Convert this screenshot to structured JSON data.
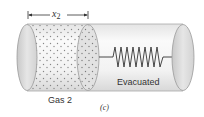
{
  "figure": {
    "dimension": {
      "symbol": "x",
      "subscript": "2"
    },
    "region_labels": {
      "gas": "Gas 2",
      "vacuum": "Evacuated"
    },
    "caption": "(c)"
  },
  "colors": {
    "cylinder_fill": "#eeeeee",
    "cylinder_edge": "#a8a8a8",
    "cap_fill": "#dcdcdc",
    "gas_dots": "#7a7a7a",
    "spring": "#333333",
    "text": "#333333"
  },
  "components": [
    {
      "name": "left-end-cap"
    },
    {
      "name": "gas-region",
      "dotted": true
    },
    {
      "name": "piston"
    },
    {
      "name": "spring",
      "coils": 8
    },
    {
      "name": "right-end-cap"
    }
  ]
}
